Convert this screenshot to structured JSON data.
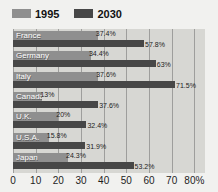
{
  "legend": {
    "items": [
      {
        "label": "1995",
        "color": "#8f8f8f"
      },
      {
        "label": "2030",
        "color": "#474747"
      }
    ]
  },
  "chart_data": {
    "type": "bar",
    "orientation": "horizontal",
    "title": "",
    "xlabel": "",
    "ylabel": "",
    "categories": [
      "France",
      "Germany",
      "Italy",
      "Canada",
      "U.K.",
      "U.S.A.",
      "Japan"
    ],
    "series": [
      {
        "name": "1995",
        "color": "#8f8f8f",
        "values": [
          37.4,
          34.4,
          37.6,
          13,
          20,
          15.8,
          24.3
        ],
        "labels": [
          "37.4%",
          "34.4%",
          "37.6%",
          "13%",
          "20%",
          "15.8%",
          "24.3%"
        ]
      },
      {
        "name": "2030",
        "color": "#474747",
        "values": [
          57.8,
          63,
          71.5,
          37.6,
          32.4,
          31.9,
          53.2
        ],
        "labels": [
          "57.8%",
          "63%",
          "71.5%",
          "37.6%",
          "32.4%",
          "31.9%",
          "53.2%"
        ]
      }
    ],
    "xticks": [
      0,
      10,
      20,
      30,
      40,
      50,
      60,
      70,
      80
    ],
    "xtick_labels": [
      "0",
      "10",
      "20",
      "30",
      "40",
      "50",
      "60",
      "70",
      "80%"
    ],
    "xlim": [
      0,
      84.7
    ],
    "grid": true,
    "legend_position": "top",
    "plot_background": "#d7d7d3",
    "gridline_color": "#9e9e9c"
  }
}
